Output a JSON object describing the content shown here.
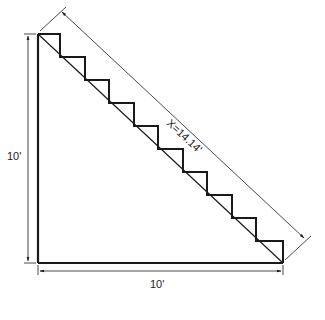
{
  "diagram": {
    "labels": {
      "vertical_dimension": "10'",
      "horizontal_dimension": "10'",
      "hypotenuse_dimension": "X=14.14'"
    },
    "steps_count": 10,
    "colors": {
      "line": "#1a1a1a",
      "background": "#ffffff"
    }
  }
}
